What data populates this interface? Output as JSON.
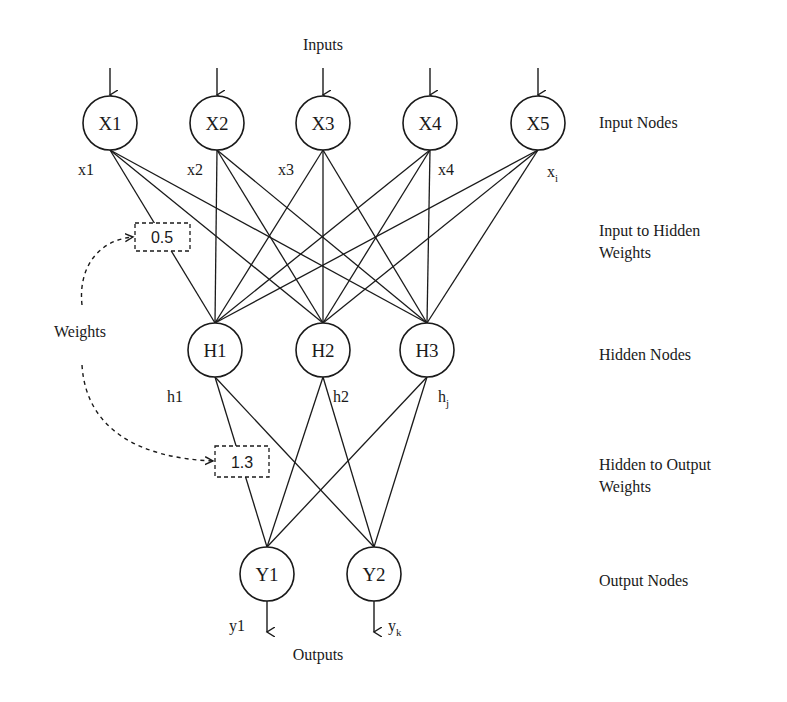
{
  "diagram": {
    "title_top": "Inputs",
    "title_bottom": "Outputs",
    "weights_label": "Weights",
    "node_radius": 27,
    "input_nodes": [
      {
        "id": "X1",
        "label": "X1",
        "var": "x1",
        "x": 110,
        "y": 123
      },
      {
        "id": "X2",
        "label": "X2",
        "var": "x2",
        "x": 217,
        "y": 123
      },
      {
        "id": "X3",
        "label": "X3",
        "var": "x3",
        "x": 323,
        "y": 123
      },
      {
        "id": "X4",
        "label": "X4",
        "var": "x4",
        "x": 430,
        "y": 123
      },
      {
        "id": "X5",
        "label": "X5",
        "var": "x",
        "var_sub": "i",
        "x": 538,
        "y": 123
      }
    ],
    "hidden_nodes": [
      {
        "id": "H1",
        "label": "H1",
        "var": "h1",
        "x": 215,
        "y": 350
      },
      {
        "id": "H2",
        "label": "H2",
        "var": "h2",
        "x": 323,
        "y": 350
      },
      {
        "id": "H3",
        "label": "H3",
        "var": "h",
        "var_sub": "j",
        "x": 427,
        "y": 350
      }
    ],
    "output_nodes": [
      {
        "id": "Y1",
        "label": "Y1",
        "var": "y1",
        "x": 267,
        "y": 574
      },
      {
        "id": "Y2",
        "label": "Y2",
        "var": "y",
        "var_sub": "k",
        "x": 374,
        "y": 574
      }
    ],
    "example_weights": [
      {
        "value": "0.5",
        "between": "X1-H1",
        "box": {
          "x": 135,
          "y": 223,
          "w": 55,
          "h": 28
        }
      },
      {
        "value": "1.3",
        "between": "H1-Y1",
        "box": {
          "x": 215,
          "y": 446,
          "w": 54,
          "h": 31
        }
      }
    ],
    "side_labels": [
      {
        "lines": [
          "Input Nodes"
        ],
        "y": 128
      },
      {
        "lines": [
          "Input to Hidden",
          "Weights"
        ],
        "y": 236
      },
      {
        "lines": [
          "Hidden Nodes"
        ],
        "y": 360
      },
      {
        "lines": [
          "Hidden to Output",
          "Weights"
        ],
        "y": 470
      },
      {
        "lines": [
          "Output Nodes"
        ],
        "y": 586
      }
    ],
    "colors": {
      "ink": "#1a1a1a",
      "background": "#ffffff"
    }
  }
}
